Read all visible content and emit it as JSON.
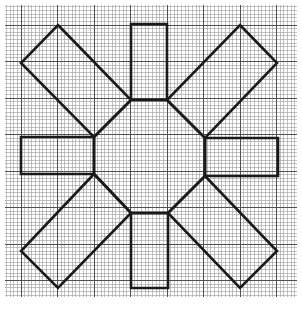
{
  "diagram": {
    "title": "",
    "type": "geometric-figure-on-graph-paper",
    "canvas": {
      "width": 302,
      "height": 319,
      "background": "#ffffff"
    },
    "grid": {
      "x0": 5,
      "y0": 5,
      "x1": 297,
      "y1": 297,
      "minor_step": 3.65,
      "major_every": 10,
      "major_origin_x": 21,
      "major_origin_y": 25,
      "minor_color": "#9a9a9a",
      "major_color": "#505050"
    },
    "stroke": {
      "color": "#1a1a1a",
      "width": 2.6
    },
    "shapes": [
      {
        "name": "rect-top",
        "kind": "rectangle",
        "points": [
          [
            131,
            24
          ],
          [
            167,
            24
          ],
          [
            167,
            100
          ],
          [
            131,
            100
          ]
        ]
      },
      {
        "name": "rect-bottom",
        "kind": "rectangle",
        "points": [
          [
            131,
            213
          ],
          [
            168,
            213
          ],
          [
            168,
            288
          ],
          [
            131,
            288
          ]
        ]
      },
      {
        "name": "rect-left",
        "kind": "rectangle",
        "points": [
          [
            21,
            137
          ],
          [
            94,
            137
          ],
          [
            94,
            174
          ],
          [
            21,
            174
          ]
        ]
      },
      {
        "name": "rect-right",
        "kind": "rectangle",
        "points": [
          [
            205,
            138
          ],
          [
            278,
            138
          ],
          [
            278,
            176
          ],
          [
            205,
            176
          ]
        ]
      },
      {
        "name": "rect-diag-top-left",
        "kind": "rotated-rectangle",
        "points": [
          [
            58,
            25
          ],
          [
            131,
            100
          ],
          [
            94,
            137
          ],
          [
            21,
            63
          ]
        ]
      },
      {
        "name": "rect-diag-top-right",
        "kind": "rotated-rectangle",
        "points": [
          [
            240,
            25
          ],
          [
            277,
            63
          ],
          [
            205,
            138
          ],
          [
            167,
            100
          ]
        ]
      },
      {
        "name": "rect-diag-bottom-left",
        "kind": "rotated-rectangle",
        "points": [
          [
            94,
            174
          ],
          [
            131,
            213
          ],
          [
            58,
            288
          ],
          [
            21,
            251
          ]
        ]
      },
      {
        "name": "rect-diag-bottom-right",
        "kind": "rotated-rectangle",
        "points": [
          [
            205,
            176
          ],
          [
            277,
            251
          ],
          [
            240,
            288
          ],
          [
            168,
            213
          ]
        ]
      },
      {
        "name": "center-octagon",
        "kind": "octagon",
        "points": [
          [
            131,
            100
          ],
          [
            167,
            100
          ],
          [
            205,
            138
          ],
          [
            205,
            176
          ],
          [
            168,
            213
          ],
          [
            131,
            213
          ],
          [
            94,
            174
          ],
          [
            94,
            137
          ]
        ]
      }
    ]
  }
}
